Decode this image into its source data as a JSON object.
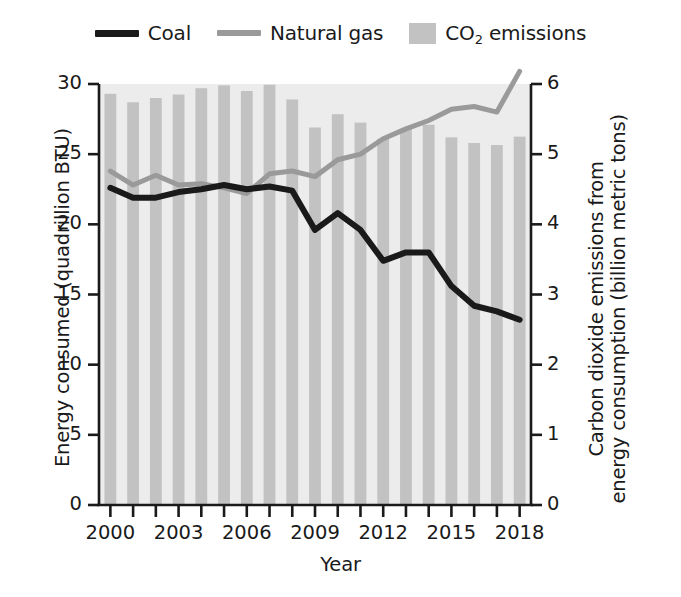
{
  "legend": {
    "items": [
      {
        "label": "Coal",
        "type": "line",
        "color": "#1a1a1a",
        "icon": "line-swatch-icon"
      },
      {
        "label": "Natural gas",
        "type": "line",
        "color": "#9a9a9a",
        "icon": "line-swatch-icon"
      },
      {
        "label": "CO2 emissions",
        "label_main": "CO",
        "label_sub": "2",
        "label_tail": " emissions",
        "type": "bar",
        "color": "#c2c2c2",
        "icon": "bar-swatch-icon"
      }
    ]
  },
  "axes": {
    "x_title": "Year",
    "y_left_title": "Energy consumed (quadrillion BTU)",
    "y_right_title_line1": "Carbon dioxide emissions from",
    "y_right_title_line2": "energy consumption (billion metric tons)",
    "y_left_ticks": [
      "0",
      "5",
      "10",
      "15",
      "20",
      "25",
      "30"
    ],
    "y_right_ticks": [
      "0",
      "1",
      "2",
      "3",
      "4",
      "5",
      "6"
    ],
    "x_ticks_labeled": [
      "2000",
      "2003",
      "2006",
      "2009",
      "2012",
      "2015",
      "2018"
    ]
  },
  "chart_data": {
    "type": "bar",
    "title": "",
    "xlabel": "Year",
    "ylabel": "Energy consumed (quadrillion BTU)",
    "y2label": "Carbon dioxide emissions from energy consumption (billion metric tons)",
    "ylim": [
      0,
      30
    ],
    "y2lim": [
      0,
      6
    ],
    "xlim": [
      1999.5,
      2018.5
    ],
    "grid": false,
    "legend_position": "top-center",
    "categories": [
      2000,
      2001,
      2002,
      2003,
      2004,
      2005,
      2006,
      2007,
      2008,
      2009,
      2010,
      2011,
      2012,
      2013,
      2014,
      2015,
      2016,
      2017,
      2018
    ],
    "series": [
      {
        "name": "CO2 emissions",
        "axis": "right",
        "render": "bar",
        "color": "#c2c2c2",
        "unit": "billion metric tons",
        "values": [
          5.86,
          5.74,
          5.8,
          5.85,
          5.94,
          5.98,
          5.9,
          5.99,
          5.78,
          5.38,
          5.57,
          5.45,
          5.22,
          5.36,
          5.42,
          5.24,
          5.16,
          5.13,
          5.25
        ]
      },
      {
        "name": "Coal",
        "axis": "left",
        "render": "line",
        "color": "#1a1a1a",
        "unit": "quadrillion BTU",
        "values": [
          22.6,
          21.9,
          21.9,
          22.3,
          22.5,
          22.8,
          22.5,
          22.7,
          22.4,
          19.6,
          20.8,
          19.6,
          17.4,
          18.0,
          18.0,
          15.6,
          14.2,
          13.8,
          13.2
        ]
      },
      {
        "name": "Natural gas",
        "axis": "left",
        "render": "line",
        "color": "#9a9a9a",
        "unit": "quadrillion BTU",
        "values": [
          23.8,
          22.8,
          23.5,
          22.8,
          22.9,
          22.6,
          22.2,
          23.6,
          23.8,
          23.4,
          24.6,
          25.0,
          26.1,
          26.8,
          27.4,
          28.2,
          28.4,
          28.0,
          30.9
        ]
      }
    ]
  }
}
